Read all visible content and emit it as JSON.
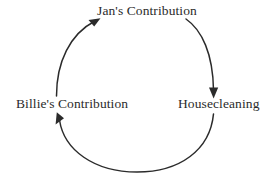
{
  "diagram": {
    "type": "causal-loop",
    "direction": "clockwise",
    "background_color": "#ffffff",
    "stroke_color": "#2b2b2b",
    "text_color": "#2b2b2b",
    "nodes": [
      {
        "id": "jan",
        "label": "Jan's Contribution",
        "position": "top"
      },
      {
        "id": "housecleaning",
        "label": "Housecleaning",
        "position": "right"
      },
      {
        "id": "billie",
        "label": "Billie's Contribution",
        "position": "left"
      }
    ],
    "edges": [
      {
        "from": "jan",
        "to": "housecleaning",
        "arrowhead": "down"
      },
      {
        "from": "housecleaning",
        "to": "billie",
        "arrowhead": "up-left"
      },
      {
        "from": "billie",
        "to": "jan",
        "arrowhead": "up-right"
      }
    ]
  }
}
